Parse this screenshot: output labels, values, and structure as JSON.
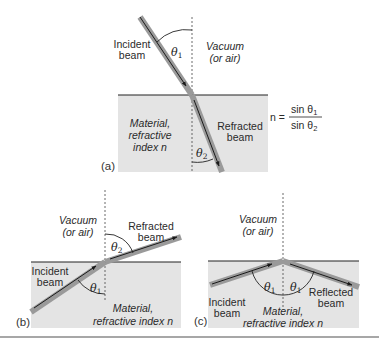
{
  "figure": {
    "panels": [
      {
        "id": "a",
        "letter": "(a)",
        "upper_medium": [
          "Vacuum",
          "(or air)"
        ],
        "lower_medium": [
          "Material,",
          "refractive",
          "index n"
        ],
        "beam_in": [
          "Incident",
          "beam"
        ],
        "beam_out": [
          "Refracted",
          "beam"
        ],
        "angle_upper": "θ",
        "angle_upper_sub": "1",
        "angle_lower": "θ",
        "angle_lower_sub": "2"
      },
      {
        "id": "b",
        "letter": "(b)",
        "upper_medium": [
          "Vacuum",
          "(or air)"
        ],
        "lower_medium": [
          "Material,",
          "refractive index n"
        ],
        "beam_in": [
          "Incident",
          "beam"
        ],
        "beam_out": [
          "Refracted",
          "beam"
        ],
        "angle_upper": "θ",
        "angle_upper_sub": "2",
        "angle_lower": "θ",
        "angle_lower_sub": "1"
      },
      {
        "id": "c",
        "letter": "(c)",
        "upper_medium": [
          "Vacuum",
          "(or air)"
        ],
        "lower_medium": [
          "Material,",
          "refractive index n"
        ],
        "beam_in": [
          "Incident",
          "beam"
        ],
        "beam_out": [
          "Reflected",
          "beam"
        ],
        "angle_left": "θ",
        "angle_left_sub": "1",
        "angle_right": "θ",
        "angle_right_sub": "1"
      }
    ],
    "equation": {
      "lhs": "n =",
      "numerator": "sin θ",
      "numerator_sub": "1",
      "denominator": "sin θ",
      "denominator_sub": "2"
    },
    "colors": {
      "material": "#e4e4e4",
      "beam_outer": "#9a9a9a",
      "beam_inner": "#1a1a1a",
      "interface": "#222222",
      "rule": "#8a8a8a"
    }
  }
}
